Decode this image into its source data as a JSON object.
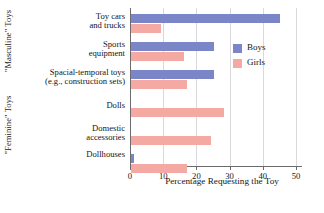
{
  "chart_data": {
    "type": "bar",
    "orientation": "horizontal",
    "title": "",
    "xlabel": "Percentage Requesting the Toy",
    "ylabel": "",
    "xlim": [
      0,
      50
    ],
    "xticks": [
      0,
      10,
      20,
      30,
      40,
      50
    ],
    "grid": "vertical",
    "legend_position": "right-upper",
    "categories": [
      "Toy cars and trucks",
      "Sports equipment",
      "Spacial-temporal toys (e.g., construction sets)",
      "Dolls",
      "Domestic accessories",
      "Dollhouses"
    ],
    "series": [
      {
        "name": "Boys",
        "color": "#7b86c9",
        "values": [
          45,
          25,
          25,
          0,
          0,
          1
        ]
      },
      {
        "name": "Girls",
        "color": "#f4aaa2",
        "values": [
          9,
          16,
          17,
          28,
          24,
          17
        ]
      }
    ],
    "group_labels": [
      {
        "text": "\"Masculine\" Toys",
        "covers": [
          "Toy cars and trucks",
          "Sports equipment",
          "Spacial-temporal toys (e.g., construction sets)"
        ]
      },
      {
        "text": "\"Feminine\" Toys",
        "covers": [
          "Dolls",
          "Domestic accessories",
          "Dollhouses"
        ]
      }
    ]
  },
  "axis": {
    "x_tick_labels": [
      "0",
      "10",
      "20",
      "30",
      "40",
      "50"
    ],
    "x_title": "Percentage Requesting the Toy"
  },
  "categories_display": [
    {
      "lines": [
        "Toy cars",
        "and trucks"
      ]
    },
    {
      "lines": [
        "Sports",
        "equipment"
      ]
    },
    {
      "lines": [
        "Spacial-temporal toys",
        "(e.g., construction sets)"
      ]
    },
    {
      "lines": [
        "Dolls"
      ]
    },
    {
      "lines": [
        "Domestic",
        "accessories"
      ]
    },
    {
      "lines": [
        "Dollhouses"
      ]
    }
  ],
  "group_axis": {
    "masculine": "\"Masculine\" Toys",
    "feminine": "\"Feminine\" Toys"
  },
  "legend": {
    "items": [
      {
        "label": "Boys",
        "color": "#7b86c9"
      },
      {
        "label": "Girls",
        "color": "#f4aaa2"
      }
    ]
  }
}
